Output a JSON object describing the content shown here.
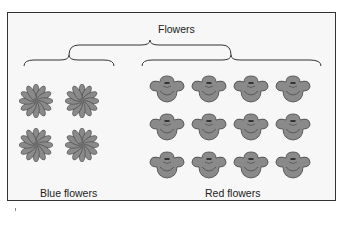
{
  "diagram": {
    "title": "Flowers",
    "groups": [
      {
        "label": "Blue flowers",
        "count": 4,
        "rows": 2,
        "cols": 2,
        "style": "daisy"
      },
      {
        "label": "Red flowers",
        "count": 12,
        "rows": 3,
        "cols": 4,
        "style": "rounded-petal"
      }
    ],
    "colors": {
      "flower_fill": "#8a8a8a",
      "flower_outline": "#444444",
      "frame_border": "#333333",
      "background": "#f7f7f7"
    }
  }
}
